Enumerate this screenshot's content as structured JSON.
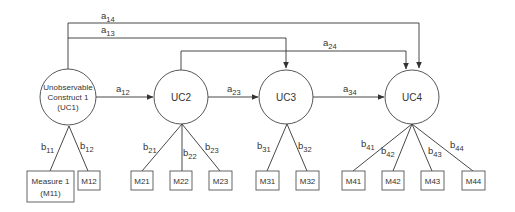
{
  "constructs": [
    {
      "id": "UC1",
      "label_lines": [
        "Unobservable",
        "Construct 1",
        "(UC1)"
      ]
    },
    {
      "id": "UC2",
      "label": "UC2"
    },
    {
      "id": "UC3",
      "label": "UC3"
    },
    {
      "id": "UC4",
      "label": "UC4"
    }
  ],
  "measures": {
    "M11": [
      "Measure 1",
      "(M11)"
    ],
    "M12": "M12",
    "M21": "M21",
    "M22": "M22",
    "M23": "M23",
    "M31": "M31",
    "M32": "M32",
    "M41": "M41",
    "M42": "M42",
    "M43": "M43",
    "M44": "M44"
  },
  "paths": {
    "a12": {
      "base": "a",
      "sub": "12"
    },
    "a13": {
      "base": "a",
      "sub": "13"
    },
    "a14": {
      "base": "a",
      "sub": "14"
    },
    "a23": {
      "base": "a",
      "sub": "23"
    },
    "a24": {
      "base": "a",
      "sub": "24"
    },
    "a34": {
      "base": "a",
      "sub": "34"
    }
  },
  "loadings": {
    "b11": {
      "base": "b",
      "sub": "11"
    },
    "b12": {
      "base": "b",
      "sub": "12"
    },
    "b21": {
      "base": "b",
      "sub": "21"
    },
    "b22": {
      "base": "b",
      "sub": "22"
    },
    "b23": {
      "base": "b",
      "sub": "23"
    },
    "b31": {
      "base": "b",
      "sub": "31"
    },
    "b32": {
      "base": "b",
      "sub": "32"
    },
    "b41": {
      "base": "b",
      "sub": "41"
    },
    "b42": {
      "base": "b",
      "sub": "42"
    },
    "b43": {
      "base": "b",
      "sub": "43"
    },
    "b44": {
      "base": "b",
      "sub": "44"
    }
  }
}
